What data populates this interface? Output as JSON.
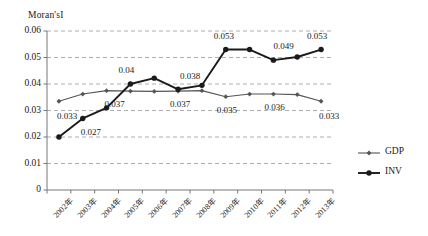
{
  "chart_data": {
    "type": "line",
    "title": "",
    "ylabel": "Moran'sI",
    "xlabel": "",
    "ylim": [
      0,
      0.06
    ],
    "yticks": [
      "0",
      "0.01",
      "0.02",
      "0.03",
      "0.04",
      "0.05",
      "0.06"
    ],
    "ytick_values": [
      0,
      0.01,
      0.02,
      0.03,
      0.04,
      0.05,
      0.06
    ],
    "grid": "horizontal-dashed",
    "legend_position": "right",
    "categories": [
      "2002年",
      "2003年",
      "2004年",
      "2005年",
      "2006年",
      "2007年",
      "2008年",
      "2009年",
      "2010年",
      "2011年",
      "2012年",
      "2013年"
    ],
    "series": [
      {
        "name": "GDP",
        "values": [
          0.0335,
          0.0362,
          0.0375,
          0.0373,
          0.0372,
          0.0373,
          0.0375,
          0.0352,
          0.0362,
          0.0362,
          0.036,
          0.0335
        ]
      },
      {
        "name": "INV",
        "values": [
          0.02,
          0.027,
          0.031,
          0.04,
          0.0422,
          0.038,
          0.0395,
          0.053,
          0.053,
          0.049,
          0.0502,
          0.053
        ]
      }
    ],
    "point_labels": [
      {
        "text": "0.033",
        "series": "GDP",
        "index": 0
      },
      {
        "text": "0.027",
        "series": "INV",
        "index": 1
      },
      {
        "text": "0.04",
        "series": "INV",
        "index": 3
      },
      {
        "text": "0.037",
        "series": "GDP",
        "index": 2
      },
      {
        "text": "0.038",
        "series": "INV",
        "index": 5
      },
      {
        "text": "0.037",
        "series": "GDP",
        "index": 5
      },
      {
        "text": "0.053",
        "series": "INV",
        "index": 7
      },
      {
        "text": "0.035",
        "series": "GDP",
        "index": 7
      },
      {
        "text": "0.049",
        "series": "INV",
        "index": 9
      },
      {
        "text": "0.036",
        "series": "GDP",
        "index": 9
      },
      {
        "text": "0.053",
        "series": "INV",
        "index": 11
      },
      {
        "text": "0.033",
        "series": "GDP",
        "index": 11
      }
    ],
    "colors": {
      "gdp_line": "#555555",
      "inv_line": "#1a1a1a",
      "grid": "#9a9a9a",
      "axis": "#777777",
      "text": "#1a1a1a"
    }
  },
  "legend": {
    "items": [
      {
        "label": "GDP"
      },
      {
        "label": "INV"
      }
    ]
  }
}
